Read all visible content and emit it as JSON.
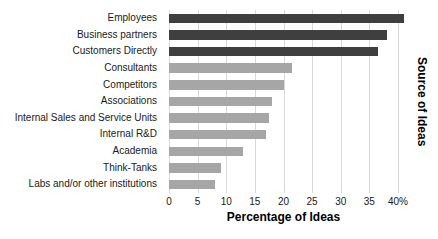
{
  "chart_data": {
    "type": "bar",
    "orientation": "horizontal",
    "title": "",
    "categories": [
      "Employees",
      "Business partners",
      "Customers Directly",
      "Consultants",
      "Competitors",
      "Associations",
      "Internal Sales and Service Units",
      "Internal R&D",
      "Academia",
      "Think-Tanks",
      "Labs and/or other institutions"
    ],
    "values": [
      41,
      38,
      36.5,
      21.5,
      20,
      18,
      17.5,
      17,
      13,
      9,
      8
    ],
    "bar_colors": [
      "#3f3f3f",
      "#3f3f3f",
      "#3f3f3f",
      "#a6a6a6",
      "#a6a6a6",
      "#a6a6a6",
      "#a6a6a6",
      "#a6a6a6",
      "#a6a6a6",
      "#a6a6a6",
      "#a6a6a6"
    ],
    "xlabel": "Percentage of Ideas",
    "ylabel": "Source of Ideas",
    "xlim": [
      0,
      40
    ],
    "xticks": [
      "0",
      "5",
      "10",
      "15",
      "20",
      "25",
      "30",
      "35",
      "40%"
    ],
    "xtick_values": [
      0,
      5,
      10,
      15,
      20,
      25,
      30,
      35,
      40
    ],
    "grid": "vertical",
    "gridline_color": "#d9d9d9",
    "legend": "none",
    "background_color": "#ffffff"
  }
}
